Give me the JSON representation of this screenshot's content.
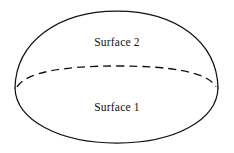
{
  "figure": {
    "background_color": "#ffffff",
    "stroke_color": "#111111",
    "labels": {
      "upper": "Surface 2",
      "lower": "Surface 1"
    },
    "geometry": {
      "apex": {
        "x": 117,
        "y": 11
      },
      "left_cusp": {
        "x": 15,
        "y": 88
      },
      "right_cusp": {
        "x": 218,
        "y": 88
      },
      "base_bottom": {
        "x": 117,
        "y": 143
      },
      "hidden_edge_apex": {
        "x": 117,
        "y": 66
      },
      "dome_path": "M 15 88 C 16 42 58 11 117 11 C 176 11 217 42 218 88",
      "base_front_path": "M 15 88 C 16 120 59 143 117 143 C 175 143 217 120 218 88",
      "hidden_edge_path": "M 17 87 C 26 72 64 66 117 66 C 170 66 208 72 216 87",
      "dash_pattern": "8 5"
    },
    "label_positions": {
      "upper": {
        "x": 117,
        "y": 46
      },
      "lower": {
        "x": 117,
        "y": 111
      }
    }
  }
}
